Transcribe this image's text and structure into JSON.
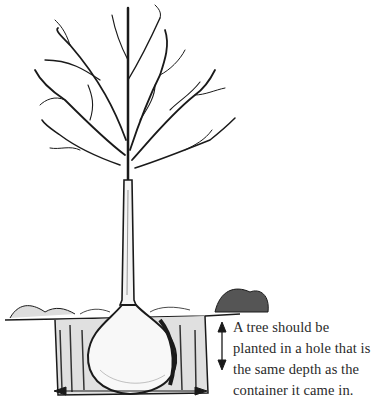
{
  "diagram": {
    "caption_lines": [
      "A tree should be",
      "planted in a hole that is",
      "the same depth as the",
      "container it came in."
    ],
    "labels": {
      "depth_arrow": "vertical-double-arrow",
      "width_arrow": "horizontal-double-arrow"
    },
    "colors": {
      "ink": "#1a1a1a",
      "background": "#ffffff",
      "text": "#2a2a2a"
    }
  }
}
